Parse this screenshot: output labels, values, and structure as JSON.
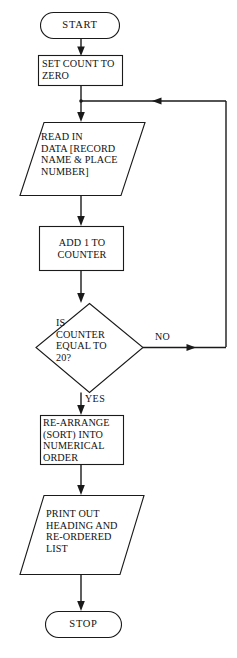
{
  "diagram": {
    "type": "flowchart",
    "canvas": {
      "width": 237,
      "height": 658
    },
    "style": {
      "stroke_color": "#1a1a1a",
      "fill_color": "#ffffff",
      "text_color": "#111111"
    },
    "nodes": [
      {
        "id": "start",
        "shape": "terminator",
        "label": "START",
        "x": 40,
        "y": 12,
        "w": 80,
        "h": 27
      },
      {
        "id": "set-count",
        "shape": "process",
        "label": "SET COUNT TO\nZERO",
        "x": 38,
        "y": 55,
        "w": 85,
        "h": 31
      },
      {
        "id": "read-in",
        "shape": "io-parallelogram",
        "label": "READ IN\nDATA [RECORD\nNAME & PLACE\nNUMBER]",
        "x": 20,
        "y": 122,
        "w": 125,
        "h": 74
      },
      {
        "id": "add-one",
        "shape": "process",
        "label": "ADD 1 TO\nCOUNTER",
        "x": 39,
        "y": 226,
        "w": 85,
        "h": 45
      },
      {
        "id": "decision",
        "shape": "decision-diamond",
        "label": "IS\nCOUNTER\nEQUAL TO\n20?",
        "x": 36,
        "y": 303,
        "w": 107,
        "h": 90
      },
      {
        "id": "re-arrange",
        "shape": "process",
        "label": "RE-ARRANGE\n(SORT) INTO\nNUMERICAL\nORDER",
        "x": 40,
        "y": 415,
        "w": 84,
        "h": 50
      },
      {
        "id": "print-out",
        "shape": "io-parallelogram",
        "label": "PRINT OUT\nHEADING AND\nRE-ORDERED\nLIST",
        "x": 20,
        "y": 495,
        "w": 124,
        "h": 80
      },
      {
        "id": "stop",
        "shape": "terminator",
        "label": "STOP",
        "x": 45,
        "y": 611,
        "w": 77,
        "h": 27
      }
    ],
    "edge_labels": [
      {
        "id": "no-label",
        "text": "NO",
        "x": 155,
        "y": 331
      },
      {
        "id": "yes-label",
        "text": "YES",
        "x": 85,
        "y": 393
      }
    ],
    "connectors": [
      {
        "id": "start-to-set-count",
        "from": "start",
        "to": "set-count"
      },
      {
        "id": "set-count-to-read-in",
        "from": "set-count",
        "to": "read-in"
      },
      {
        "id": "read-in-to-add-one",
        "from": "read-in",
        "to": "add-one"
      },
      {
        "id": "add-one-to-decision",
        "from": "add-one",
        "to": "decision"
      },
      {
        "id": "decision-no-loop",
        "from": "decision",
        "to": "read-in",
        "label": "NO"
      },
      {
        "id": "decision-yes-to-re-arrange",
        "from": "decision",
        "to": "re-arrange",
        "label": "YES"
      },
      {
        "id": "re-arrange-to-print-out",
        "from": "re-arrange",
        "to": "print-out"
      },
      {
        "id": "print-out-to-stop",
        "from": "print-out",
        "to": "stop"
      }
    ]
  }
}
